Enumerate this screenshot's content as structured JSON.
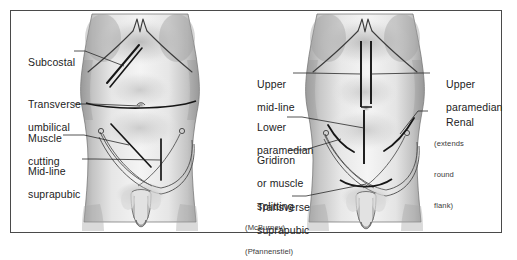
{
  "figure": {
    "border_color": "#4a4a4a",
    "background_color": "#ffffff",
    "ink_color": "#1a1a1a",
    "panels": [
      {
        "id": "left-panel",
        "name": "left-torso-figure",
        "description": "Male abdomen anterior view with transverse and oblique incision markings"
      },
      {
        "id": "right-panel",
        "name": "right-torso-figure",
        "description": "Male abdomen anterior view with vertical midline and paramedian incision markings"
      }
    ]
  },
  "left_labels": [
    {
      "id": "subcostal",
      "text": "Subcostal"
    },
    {
      "id": "transverse-umbilical",
      "line1": "Transverse",
      "line2": "umbilical"
    },
    {
      "id": "muscle-cutting",
      "line1": "Muscle",
      "line2": "cutting"
    },
    {
      "id": "mid-line-suprapubic",
      "line1": "Mid-line",
      "line2": "suprapubic"
    }
  ],
  "right_labels": [
    {
      "id": "upper-mid-line",
      "line1": "Upper",
      "line2": "mid-line"
    },
    {
      "id": "lower-paramedian",
      "line1": "Lower",
      "line2": "paramedian"
    },
    {
      "id": "gridiron",
      "line1": "Gridiron",
      "line2": "or muscle",
      "line3": "splitting",
      "sub": "(McBurney)"
    },
    {
      "id": "transverse-suprapubic",
      "line1": "Transverse",
      "line2": "suprapubic",
      "sub": "(Pfannenstiel)"
    },
    {
      "id": "upper-paramedian",
      "line1": "Upper",
      "line2": "paramedian"
    },
    {
      "id": "renal",
      "line1": "Renal",
      "sub1": "(extends",
      "sub2": "round",
      "sub3": "flank)"
    }
  ]
}
